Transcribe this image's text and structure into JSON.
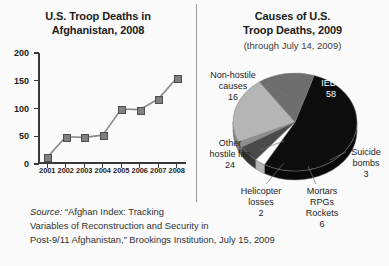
{
  "left_chart": {
    "title_line1": "U.S. Troop Deaths in",
    "title_line2": "Afghanistan, 2008"
  },
  "right_chart": {
    "title_line1": "Causes of U.S.",
    "title_line2": "Troop Deaths, 2009",
    "subtitle": "(through July 14, 2009)"
  },
  "source": {
    "label": "Source:",
    "text_line1": " “Afghan Index: Tracking",
    "text_line2": "Variables of Reconstruction and Security in",
    "text_line3": "Post-9/11 Afghanistan,” Brookings Institution, July 15, 2009"
  },
  "colors": {
    "background": "#fbfbfb",
    "axis": "#3a3a3a",
    "line": "#8a8a8a",
    "marker": "#808080",
    "ieds": "#0d0d0d",
    "non_hostile": "#6e6e6e",
    "other_hostile": "#b5b5b5",
    "helicopter": "#8f8f8f",
    "mortars": "#4a4a4a",
    "suicide": "#fcfcfc",
    "pie_side": "#7c7c7c",
    "divider": "#9a9a9a",
    "label_text": "#1c1c1c"
  },
  "chart_data": [
    {
      "type": "line",
      "title": "U.S. Troop Deaths in Afghanistan, 2008",
      "xlabel": "",
      "ylabel": "",
      "x": [
        "2001",
        "2002",
        "2003",
        "2004",
        "2005",
        "2006",
        "2007",
        "2008"
      ],
      "values": [
        12,
        49,
        48,
        52,
        99,
        98,
        117,
        155
      ],
      "ylim": [
        0,
        200
      ],
      "yticks": [
        0,
        50,
        100,
        150,
        200
      ],
      "ytick_labels": [
        "0",
        "50",
        "100",
        "150",
        "200"
      ],
      "grid": false,
      "legend": "none",
      "markers": "square"
    },
    {
      "type": "pie",
      "title": "Causes of U.S. Troop Deaths, 2009",
      "subtitle": "(through July 14, 2009)",
      "total": 109,
      "legend": "callout-labels",
      "slices": [
        {
          "label": "IEDs",
          "label_lines": [
            "IEDs"
          ],
          "value": 58,
          "color": "#0d0d0d",
          "text_color": "#ffffff",
          "inside": true
        },
        {
          "label": "Suicide bombs",
          "label_lines": [
            "Suicide",
            "bombs"
          ],
          "value": 3,
          "color": "#fcfcfc",
          "text_color": "#1c1c1c",
          "inside": false
        },
        {
          "label": "Mortars RPGs Rockets",
          "label_lines": [
            "Mortars",
            "RPGs",
            "Rockets"
          ],
          "value": 6,
          "color": "#4a4a4a",
          "text_color": "#1c1c1c",
          "inside": false
        },
        {
          "label": "Helicopter losses",
          "label_lines": [
            "Helicopter",
            "losses"
          ],
          "value": 2,
          "color": "#8f8f8f",
          "text_color": "#1c1c1c",
          "inside": false
        },
        {
          "label": "Other hostile fire",
          "label_lines": [
            "Other",
            "hostile fire"
          ],
          "value": 24,
          "color": "#b5b5b5",
          "text_color": "#1c1c1c",
          "inside": false
        },
        {
          "label": "Non-hostile causes",
          "label_lines": [
            "Non-hostile",
            "causes"
          ],
          "value": 16,
          "color": "#6e6e6e",
          "text_color": "#1c1c1c",
          "inside": false
        }
      ]
    }
  ],
  "pie_labels": {
    "ieds": {
      "l1": "IEDs",
      "l2": "58"
    },
    "non_hostile": {
      "l1": "Non-hostile",
      "l2": "causes",
      "l3": "16"
    },
    "other_hostile": {
      "l1": "Other",
      "l2": "hostile fire",
      "l3": "24"
    },
    "helicopter": {
      "l1": "Helicopter",
      "l2": "losses",
      "l3": "2"
    },
    "mortars": {
      "l1": "Mortars",
      "l2": "RPGs",
      "l3": "Rockets",
      "l4": "6"
    },
    "suicide": {
      "l1": "Suicide",
      "l2": "bombs",
      "l3": "3"
    }
  }
}
